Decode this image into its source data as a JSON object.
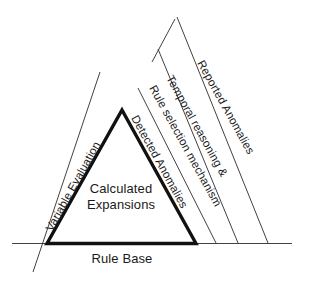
{
  "diagram": {
    "type": "layered-triangle-diagram",
    "background_color": "#ffffff",
    "stroke_color": "#1a1a1a",
    "labels": {
      "center_line1": "Calculated",
      "center_line2": "Expansions",
      "base": "Rule Base",
      "left_edge": "Variable Evaluation",
      "right_layer_1": "Detected Anomalies",
      "right_layer_2": "Rule selection mechanism",
      "right_layer_3": "Temporal reasoning &",
      "right_layer_4": "Reported Anomalies"
    }
  }
}
